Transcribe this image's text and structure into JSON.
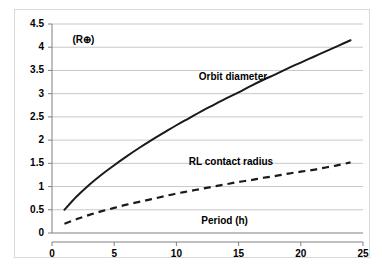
{
  "chart_data": {
    "type": "line",
    "title": "",
    "xlabel": "Period (h)",
    "ylabel": "(R⊕)",
    "xlim": [
      0,
      25
    ],
    "ylim": [
      0,
      4.5
    ],
    "xticks": [
      "0",
      "5",
      "10",
      "15",
      "20",
      "25"
    ],
    "yticks": [
      "0",
      "0.5",
      "1",
      "1.5",
      "2",
      "2.5",
      "3",
      "3.5",
      "4",
      "4.5"
    ],
    "grid": "horizontal",
    "legend_position": "inline-annotation",
    "x": [
      1,
      2,
      3,
      4,
      5,
      6,
      7,
      8,
      9,
      10,
      11,
      12,
      13,
      14,
      15,
      16,
      17,
      18,
      19,
      20,
      21,
      22,
      23,
      24
    ],
    "series": [
      {
        "name": "Orbit diameter",
        "style": "solid",
        "color": "#1a1a1a",
        "values": [
          0.5,
          0.79,
          1.04,
          1.26,
          1.46,
          1.65,
          1.83,
          2.0,
          2.16,
          2.32,
          2.47,
          2.62,
          2.76,
          2.9,
          3.03,
          3.17,
          3.3,
          3.42,
          3.55,
          3.67,
          3.79,
          3.91,
          4.03,
          4.15
        ],
        "label_text": "Orbit diameter"
      },
      {
        "name": "RL contact radius",
        "style": "dashed",
        "color": "#1a1a1a",
        "values": [
          0.2,
          0.3,
          0.39,
          0.47,
          0.54,
          0.61,
          0.67,
          0.73,
          0.79,
          0.85,
          0.9,
          0.95,
          1.0,
          1.05,
          1.1,
          1.14,
          1.19,
          1.23,
          1.28,
          1.32,
          1.36,
          1.41,
          1.46,
          1.52
        ],
        "label_text": "RL contact radius"
      }
    ],
    "annotations": [
      {
        "text": "Orbit diameter",
        "x": 11.8,
        "y": 3.35
      },
      {
        "text": "RL contact radius",
        "x": 11.0,
        "y": 1.52
      },
      {
        "text": "Period (h)",
        "x": 12.0,
        "y": 0.25
      },
      {
        "text": "(R⊕)",
        "x": 1.0,
        "y": 4.15
      }
    ]
  },
  "axis": {
    "y_unit_label": "(R⊕)",
    "x_title": "Period (h)"
  },
  "colors": {
    "line": "#1a1a1a",
    "grid": "#c8c8c8",
    "axis": "#808080",
    "background": "#ffffff",
    "frame": "#d9d9d9"
  }
}
